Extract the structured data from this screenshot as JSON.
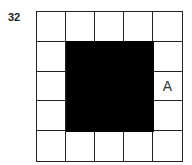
{
  "question_number": "32",
  "grid": {
    "rows": 5,
    "cols": 5,
    "filled_region": {
      "row_start": 1,
      "row_end": 3,
      "col_start": 1,
      "col_end": 3,
      "color": "#000000"
    },
    "labels": [
      {
        "row": 2,
        "col": 4,
        "text": "A"
      }
    ]
  }
}
